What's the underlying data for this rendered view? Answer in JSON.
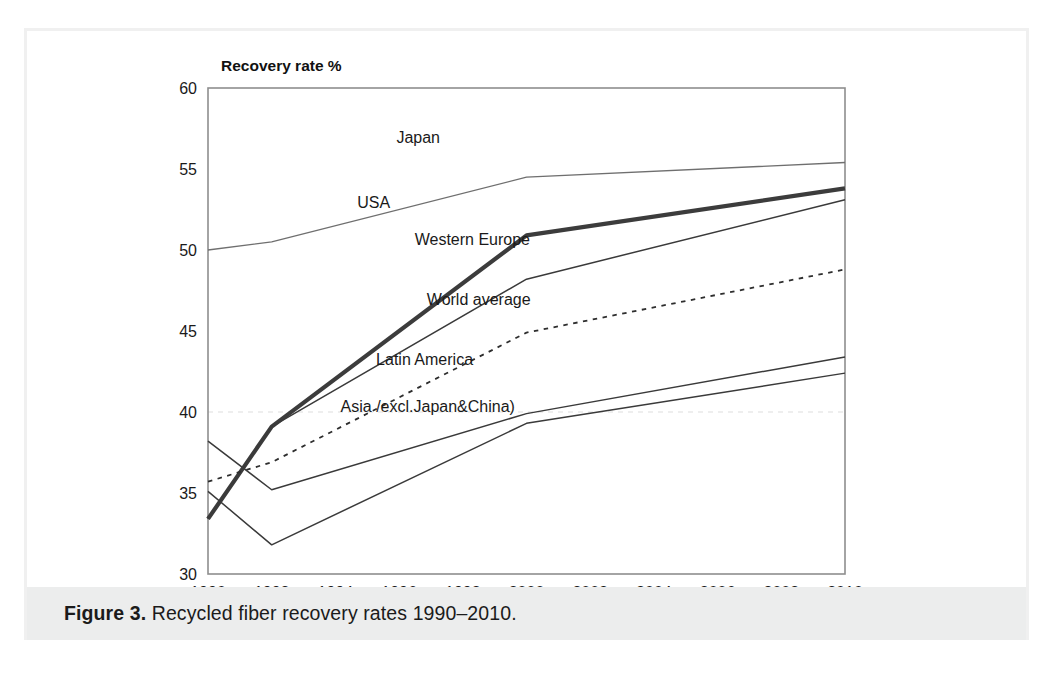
{
  "figure": {
    "caption_label": "Figure 3.",
    "caption_text": "Recycled fiber recovery rates 1990–2010."
  },
  "chart_data": {
    "type": "line",
    "title": "",
    "ylabel": "Recovery rate %",
    "xlabel": "",
    "xlim": [
      1990,
      2010
    ],
    "ylim": [
      30,
      60
    ],
    "ytick_labels": [
      "30",
      "35",
      "40",
      "45",
      "50",
      "55",
      "60"
    ],
    "yticks": [
      30,
      35,
      40,
      45,
      50,
      55,
      60
    ],
    "xtick_labels": [
      "1990",
      "1992",
      "1994",
      "1996",
      "1998",
      "2000",
      "2002",
      "2004",
      "2006",
      "2008",
      "2010"
    ],
    "xticks": [
      1990,
      1992,
      1994,
      1996,
      1998,
      2000,
      2002,
      2004,
      2006,
      2008,
      2010
    ],
    "grid": "horizontal-dashed-at-40",
    "legend": "inline-labels",
    "x": [
      1990,
      1992,
      2000,
      2010
    ],
    "series": [
      {
        "name": "Japan",
        "label": "Japan",
        "style": "thin-light",
        "values": [
          50.0,
          50.5,
          54.5,
          55.4
        ],
        "label_x": 1996.6,
        "label_y": 56.6
      },
      {
        "name": "USA",
        "label": "USA",
        "style": "thick",
        "values": [
          33.4,
          39.1,
          50.9,
          53.8
        ],
        "label_x": 1995.2,
        "label_y": 52.6
      },
      {
        "name": "Western Europe",
        "label": "Western Europe",
        "style": "plain",
        "values": [
          33.4,
          39.1,
          48.2,
          53.1
        ],
        "label_x": 1998.3,
        "label_y": 50.3
      },
      {
        "name": "World average",
        "label": "World average",
        "style": "dotted",
        "values": [
          35.7,
          36.9,
          44.9,
          48.8
        ],
        "label_x": 1998.5,
        "label_y": 46.6
      },
      {
        "name": "Latin America",
        "label": "Latin America",
        "style": "plain",
        "values": [
          38.2,
          35.2,
          39.9,
          43.4
        ],
        "label_x": 1996.8,
        "label_y": 42.9
      },
      {
        "name": "Asia (excl. Japan & China)",
        "label": "Asia /excl.Japan&China)",
        "style": "plain",
        "values": [
          35.1,
          31.8,
          39.3,
          42.4
        ],
        "label_x": 1996.9,
        "label_y": 40.0
      }
    ]
  }
}
